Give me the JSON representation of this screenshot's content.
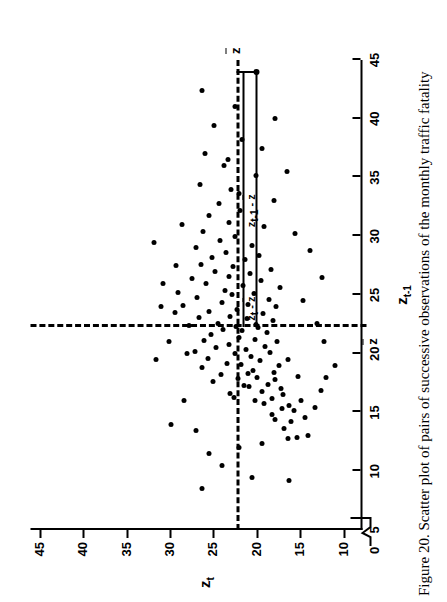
{
  "figure": {
    "caption": "Figure 20.  Scatter plot of pairs of successive observations of the monthly traffic fatality",
    "caption_number": "Figure 20.",
    "origin_label": "0"
  },
  "annotations": {
    "bracket_top_label": "z t  - z̄ ",
    "bracket_side_label": "z t-1 - z̄ ",
    "mean_x_label": "z̄ ",
    "mean_y_label": "z̄ "
  },
  "chart_data": {
    "type": "scatter",
    "title": "",
    "xlabel": "z t-1",
    "ylabel": "z t",
    "xlim": [
      5,
      45
    ],
    "ylim": [
      8,
      46
    ],
    "xticks": [
      5,
      10,
      15,
      20,
      25,
      30,
      35,
      40,
      45
    ],
    "yticks": [
      10,
      15,
      20,
      25,
      30,
      35,
      40,
      45
    ],
    "xticklabels": [
      "5",
      "10",
      "15",
      "20",
      "25",
      "30",
      "35",
      "40",
      "45"
    ],
    "yticklabels": [
      "10",
      "15",
      "20",
      "25",
      "30",
      "35",
      "40",
      "45"
    ],
    "grid": false,
    "legend": null,
    "axis_break_x": true,
    "mean_x": 22.3,
    "mean_y": 22.3,
    "highlighted_point": [
      44.0,
      20.0
    ],
    "points": [
      [
        9.2,
        16.2
      ],
      [
        12.4,
        19.3
      ],
      [
        12.8,
        16.3
      ],
      [
        12.9,
        15.3
      ],
      [
        13.0,
        14.0
      ],
      [
        13.6,
        16.8
      ],
      [
        14.2,
        16.0
      ],
      [
        14.4,
        17.8
      ],
      [
        14.6,
        14.4
      ],
      [
        14.8,
        18.2
      ],
      [
        15.2,
        15.7
      ],
      [
        15.3,
        17.0
      ],
      [
        15.4,
        13.2
      ],
      [
        15.6,
        16.2
      ],
      [
        15.8,
        19.1
      ],
      [
        16.0,
        20.1
      ],
      [
        16.0,
        14.9
      ],
      [
        16.2,
        18.2
      ],
      [
        16.3,
        22.6
      ],
      [
        16.5,
        16.9
      ],
      [
        16.6,
        23.0
      ],
      [
        16.8,
        19.4
      ],
      [
        16.9,
        12.6
      ],
      [
        17.0,
        17.2
      ],
      [
        17.2,
        20.8
      ],
      [
        17.3,
        21.4
      ],
      [
        17.4,
        18.6
      ],
      [
        17.6,
        25.0
      ],
      [
        17.8,
        17.9
      ],
      [
        17.9,
        22.1
      ],
      [
        18.0,
        19.9
      ],
      [
        18.1,
        15.2
      ],
      [
        18.2,
        24.1
      ],
      [
        18.3,
        21.0
      ],
      [
        18.4,
        18.0
      ],
      [
        18.6,
        20.4
      ],
      [
        18.8,
        26.2
      ],
      [
        19.0,
        17.4
      ],
      [
        19.1,
        21.8
      ],
      [
        19.2,
        23.4
      ],
      [
        19.4,
        19.6
      ],
      [
        19.5,
        16.4
      ],
      [
        19.6,
        25.6
      ],
      [
        19.8,
        20.6
      ],
      [
        20.0,
        22.4
      ],
      [
        20.1,
        18.4
      ],
      [
        20.2,
        27.1
      ],
      [
        20.4,
        21.2
      ],
      [
        20.5,
        24.6
      ],
      [
        20.6,
        19.0
      ],
      [
        20.8,
        23.2
      ],
      [
        21.0,
        17.6
      ],
      [
        21.1,
        26.0
      ],
      [
        21.2,
        20.2
      ],
      [
        21.4,
        22.0
      ],
      [
        21.6,
        25.2
      ],
      [
        21.8,
        18.8
      ],
      [
        22.0,
        21.6
      ],
      [
        22.1,
        23.8
      ],
      [
        22.2,
        19.8
      ],
      [
        22.3,
        22.3
      ],
      [
        22.4,
        27.8
      ],
      [
        22.5,
        20.0
      ],
      [
        22.6,
        24.4
      ],
      [
        22.8,
        18.1
      ],
      [
        23.0,
        21.1
      ],
      [
        23.1,
        26.6
      ],
      [
        23.2,
        23.0
      ],
      [
        23.4,
        19.2
      ],
      [
        23.6,
        25.4
      ],
      [
        23.8,
        22.2
      ],
      [
        24.0,
        17.7
      ],
      [
        24.1,
        28.4
      ],
      [
        24.2,
        20.9
      ],
      [
        24.4,
        24.0
      ],
      [
        24.6,
        18.5
      ],
      [
        24.8,
        26.8
      ],
      [
        25.0,
        22.8
      ],
      [
        25.1,
        20.3
      ],
      [
        25.2,
        29.0
      ],
      [
        25.4,
        23.6
      ],
      [
        25.6,
        17.3
      ],
      [
        25.8,
        21.5
      ],
      [
        26.0,
        25.8
      ],
      [
        26.2,
        19.5
      ],
      [
        26.4,
        27.4
      ],
      [
        26.6,
        23.2
      ],
      [
        26.8,
        20.7
      ],
      [
        27.0,
        24.8
      ],
      [
        27.2,
        18.3
      ],
      [
        27.4,
        22.7
      ],
      [
        27.6,
        26.4
      ],
      [
        28.0,
        21.3
      ],
      [
        28.2,
        25.1
      ],
      [
        28.4,
        19.7
      ],
      [
        28.6,
        23.5
      ],
      [
        29.0,
        27.0
      ],
      [
        29.2,
        20.5
      ],
      [
        29.6,
        24.2
      ],
      [
        30.0,
        22.5
      ],
      [
        30.4,
        26.1
      ],
      [
        30.8,
        19.1
      ],
      [
        31.2,
        23.1
      ],
      [
        31.8,
        25.5
      ],
      [
        32.2,
        21.9
      ],
      [
        32.8,
        24.3
      ],
      [
        33.6,
        22.0
      ],
      [
        34.4,
        26.5
      ],
      [
        35.2,
        20.0
      ],
      [
        36.0,
        23.7
      ],
      [
        37.0,
        25.9
      ],
      [
        38.2,
        21.7
      ],
      [
        39.4,
        24.9
      ],
      [
        41.0,
        22.4
      ],
      [
        42.4,
        26.3
      ],
      [
        44.0,
        20.0
      ],
      [
        21.0,
        30.0
      ],
      [
        19.5,
        31.5
      ],
      [
        23.5,
        29.4
      ],
      [
        20.0,
        28.0
      ],
      [
        26.0,
        30.8
      ],
      [
        27.5,
        29.2
      ],
      [
        24.0,
        31.0
      ],
      [
        31.0,
        28.6
      ],
      [
        29.5,
        31.8
      ],
      [
        13.5,
        27.0
      ],
      [
        11.5,
        25.5
      ],
      [
        14.0,
        29.8
      ],
      [
        16.0,
        28.3
      ],
      [
        12.0,
        22.0
      ],
      [
        10.5,
        24.0
      ],
      [
        8.5,
        26.2
      ],
      [
        9.5,
        20.5
      ],
      [
        33.0,
        18.0
      ],
      [
        35.5,
        16.5
      ],
      [
        37.5,
        19.3
      ],
      [
        40.0,
        17.8
      ],
      [
        30.2,
        15.5
      ],
      [
        28.8,
        13.8
      ],
      [
        26.5,
        12.4
      ],
      [
        24.5,
        14.6
      ],
      [
        22.6,
        13.0
      ],
      [
        21.0,
        12.2
      ],
      [
        19.0,
        10.9
      ],
      [
        18.0,
        12.0
      ],
      [
        34.0,
        22.9
      ],
      [
        36.5,
        23.3
      ]
    ]
  }
}
